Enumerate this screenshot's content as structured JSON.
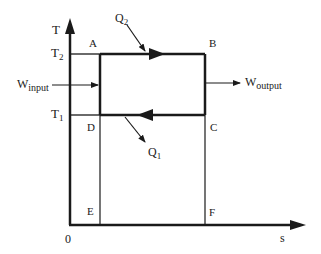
{
  "diagram": {
    "type": "T-s diagram (reversed Carnot / refrigeration cycle)",
    "axes": {
      "y_label": "T",
      "x_label": "s",
      "origin_label": "0"
    },
    "levels": {
      "upper": {
        "main": "T",
        "sub": "2"
      },
      "lower": {
        "main": "T",
        "sub": "1"
      }
    },
    "points": {
      "A": "A",
      "B": "B",
      "C": "C",
      "D": "D",
      "E": "E",
      "F": "F"
    },
    "heat": {
      "q2": {
        "main": "Q",
        "sub": "2"
      },
      "q1": {
        "main": "Q",
        "sub": "1"
      }
    },
    "work": {
      "input": {
        "main": "W",
        "sub": "input"
      },
      "output": {
        "main": "W",
        "sub": "output"
      }
    },
    "colors": {
      "line": "#1a1a1a",
      "background": "#ffffff"
    }
  }
}
